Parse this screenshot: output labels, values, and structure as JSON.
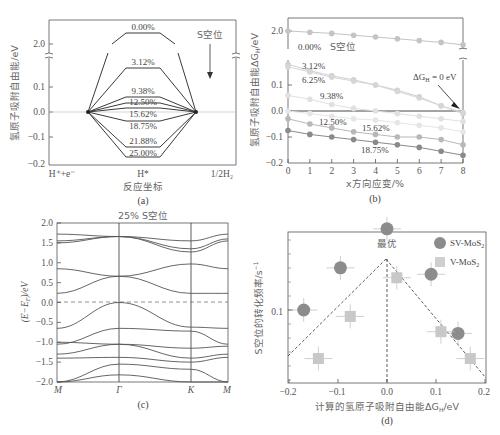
{
  "chart_data": [
    {
      "panel": "a",
      "type": "line",
      "title": "",
      "caption": "(a)",
      "xlabel": "反应坐标",
      "ylabel": "氢原子吸附自由能/eV",
      "x_categories": [
        "H⁺+e⁻",
        "H*",
        "1/2H₂"
      ],
      "yticks": [
        "2.0",
        "0.1",
        "0.0",
        "−0.1",
        "−0.2"
      ],
      "ylim": [
        -0.2,
        2.0
      ],
      "axis_break": true,
      "annotation": "S空位",
      "series": [
        {
          "name": "0.00%",
          "values": [
            0,
            2.1,
            0
          ]
        },
        {
          "name": "3.12%",
          "values": [
            0,
            0.13,
            0
          ]
        },
        {
          "name": "9.38%",
          "values": [
            0,
            0.06,
            0
          ]
        },
        {
          "name": "12.50%",
          "values": [
            0,
            0.04,
            0
          ]
        },
        {
          "name": "15.62%",
          "values": [
            0,
            0.01,
            0
          ]
        },
        {
          "name": "18.75%",
          "values": [
            0,
            -0.03,
            0
          ]
        },
        {
          "name": "21.88%",
          "values": [
            0,
            -0.14,
            0
          ]
        },
        {
          "name": "25.00%",
          "values": [
            0,
            -0.18,
            0
          ]
        }
      ]
    },
    {
      "panel": "b",
      "type": "scatter",
      "caption": "(b)",
      "xlabel": "x方向应变/%",
      "ylabel": "氢原子吸附自由能ΔG_H/eV",
      "x": [
        0,
        1,
        2,
        3,
        4,
        5,
        6,
        7,
        8
      ],
      "xticks": [
        "0",
        "1",
        "2",
        "3",
        "4",
        "5",
        "6",
        "7",
        "8"
      ],
      "yticks": [
        "2.0",
        "0.1",
        "0.0",
        "−0.1",
        "−0.2"
      ],
      "ylim": [
        -0.2,
        2.0
      ],
      "axis_break": true,
      "annotation": "ΔG_H = 0 eV",
      "annotation2": "S空位",
      "series": [
        {
          "name": "0.00%",
          "values": [
            1.97,
            1.95,
            1.93,
            1.9,
            1.87,
            1.84,
            1.81,
            1.78,
            1.74
          ]
        },
        {
          "name": "3.12%",
          "values": [
            0.18,
            0.155,
            0.135,
            0.12,
            0.1,
            0.08,
            0.055,
            0.02,
            -0.01
          ]
        },
        {
          "name": "6.25%",
          "values": [
            0.17,
            0.15,
            0.13,
            0.115,
            0.1,
            0.075,
            0.05,
            0.02,
            -0.005
          ]
        },
        {
          "name": "9.38%",
          "values": [
            0.06,
            0.045,
            0.025,
            0.01,
            0.0,
            -0.01,
            -0.02,
            -0.03,
            -0.04
          ]
        },
        {
          "name": "12.50%",
          "values": [
            0.0,
            -0.01,
            -0.02,
            -0.03,
            -0.035,
            -0.045,
            -0.055,
            -0.065,
            -0.08
          ]
        },
        {
          "name": "15.62%",
          "values": [
            -0.03,
            -0.05,
            -0.065,
            -0.08,
            -0.09,
            -0.1,
            -0.1,
            -0.11,
            -0.13
          ]
        },
        {
          "name": "18.75%",
          "values": [
            -0.075,
            -0.09,
            -0.1,
            -0.11,
            -0.12,
            -0.13,
            -0.14,
            -0.155,
            -0.17
          ]
        }
      ],
      "labels_shown": [
        "0.00%",
        "3.12%",
        "6.25%",
        "9.38%",
        "12.50%",
        "15.62%",
        "18.75%"
      ]
    },
    {
      "panel": "c",
      "type": "line",
      "title": "25% S空位",
      "caption": "(c)",
      "xlabel": "",
      "ylabel": "(E−E_F)/eV",
      "xticks": [
        "M",
        "Γ",
        "K",
        "M"
      ],
      "yticks": [
        "2.0",
        "1.5",
        "1.0",
        "0.5",
        "0.0",
        "−0.5",
        "−1.0",
        "−1.5",
        "−2.0"
      ],
      "ylim": [
        -2.0,
        2.0
      ],
      "fermi_level": 0.0,
      "bands_at_kpoints": [
        {
          "M": 1.72,
          "G": 1.66,
          "K": 1.55,
          "M2": 1.72
        },
        {
          "M": 1.55,
          "G": 1.66,
          "K": 1.35,
          "M2": 1.6
        },
        {
          "M": 1.5,
          "G": 1.66,
          "K": 1.27,
          "M2": 1.55
        },
        {
          "M": 0.85,
          "G": 0.66,
          "K": 0.97,
          "M2": 0.85
        },
        {
          "M": 0.23,
          "G": 0.66,
          "K": 0.23,
          "M2": 0.23
        },
        {
          "M": -0.65,
          "G": 0.0,
          "K": -0.62,
          "M2": -0.65
        },
        {
          "M": -1.05,
          "G": -0.65,
          "K": -0.72,
          "M2": -1.05
        },
        {
          "M": -1.0,
          "G": -1.05,
          "K": -1.15,
          "M2": -1.1
        },
        {
          "M": -1.3,
          "G": -1.05,
          "K": -1.4,
          "M2": -1.3
        },
        {
          "M": -1.4,
          "G": -1.38,
          "K": -1.5,
          "M2": -1.38
        },
        {
          "M": -2.0,
          "G": -1.55,
          "K": -1.68,
          "M2": -2.0
        },
        {
          "M": -2.0,
          "G": -1.82,
          "K": -2.0,
          "M2": -2.0
        }
      ]
    },
    {
      "panel": "d",
      "type": "scatter",
      "caption": "(d)",
      "xlabel": "计算的氢原子吸附自由能ΔG_H/eV",
      "ylabel": "S空位的转化频率/s⁻¹",
      "xticks": [
        "−0.2",
        "−0.1",
        "0.0",
        "0.1",
        "0.2"
      ],
      "xlim": [
        -0.21,
        0.21
      ],
      "yscale": "log",
      "yticks": [
        "0.1"
      ],
      "annotation": "最优",
      "legend_position": "top-right",
      "series": [
        {
          "name": "SV-MoS₂",
          "marker": "circle",
          "color": "#8c8c8c",
          "points": [
            {
              "x": -0.17,
              "y": 0.1
            },
            {
              "x": -0.095,
              "y": 0.2
            },
            {
              "x": 0.0,
              "y": 0.38
            },
            {
              "x": 0.09,
              "y": 0.18
            },
            {
              "x": 0.145,
              "y": 0.068
            }
          ]
        },
        {
          "name": "V-MoS₂",
          "marker": "square",
          "color": "#c8c8c8",
          "points": [
            {
              "x": -0.14,
              "y": 0.045
            },
            {
              "x": -0.075,
              "y": 0.09
            },
            {
              "x": 0.02,
              "y": 0.17
            },
            {
              "x": 0.11,
              "y": 0.07
            },
            {
              "x": 0.17,
              "y": 0.045
            }
          ]
        }
      ]
    }
  ],
  "panels": {
    "a": {
      "caption": "(a)",
      "xlabel": "反应坐标",
      "ylabel": "氢原子吸附自由能/eV",
      "annotation": "S空位",
      "xcat": [
        "H⁺+e⁻",
        "H*",
        "1/2H₂"
      ],
      "yticks": [
        "2.0",
        "0.1",
        "0.0",
        "−0.1",
        "−0.2"
      ],
      "levels": [
        "0.00%",
        "3.12%",
        "9.38%",
        "12.50%",
        "15.62%",
        "18.75%",
        "21.88%",
        "25.00%"
      ]
    },
    "b": {
      "caption": "(b)",
      "xlabel": "x方向应变/%",
      "ylabel": "氢原子吸附自由能ΔG",
      "ylabel_sub": "H",
      "ylabel_tail": "/eV",
      "annotation": "ΔG",
      "annotation_sub": "H",
      "annotation_tail": " = 0 eV",
      "annotation2": "S空位",
      "xticks": [
        "0",
        "1",
        "2",
        "3",
        "4",
        "5",
        "6",
        "7",
        "8"
      ],
      "yticks": [
        "2.0",
        "0.1",
        "0.0",
        "−0.1",
        "−0.2"
      ],
      "labels": [
        "0.00%",
        "3.12%",
        "6.25%",
        "9.38%",
        "12.50%",
        "15.62%",
        "18.75%"
      ]
    },
    "c": {
      "caption": "(c)",
      "title": "25% S空位",
      "ylabel": "(E−E",
      "ylabel_sub": "F",
      "ylabel_tail": ")/eV",
      "xticks": [
        "M",
        "Γ",
        "K",
        "M"
      ],
      "yticks": [
        "2.0",
        "1.5",
        "1.0",
        "0.5",
        "0.0",
        "−0.5",
        "−1.0",
        "−1.5",
        "−2.0"
      ]
    },
    "d": {
      "caption": "(d)",
      "xlabel": "计算的氢原子吸附自由能ΔG",
      "xlabel_sub": "H",
      "xlabel_tail": "/eV",
      "ylabel": "S空位的转化频率/s",
      "ylabel_sup": "−1",
      "annotation": "最优",
      "legend": [
        {
          "label": "SV-MoS",
          "sub": "2"
        },
        {
          "label": "V-MoS",
          "sub": "2"
        }
      ],
      "xticks": [
        "−0.2",
        "−0.1",
        "0.0",
        "0.1",
        "0.2"
      ],
      "yticks": [
        "0.1"
      ]
    }
  },
  "colors": {
    "axis": "#555555",
    "line_dark": "#3a3a3a",
    "sv_marker": "#8c8c8c",
    "v_marker": "#cfcfcf",
    "series_b": [
      "#c4c4c4",
      "#d0d0d0",
      "#d6d6d6",
      "#e0e0e0",
      "#e6e6e6",
      "#b8b8b8",
      "#8a8a8a"
    ]
  }
}
